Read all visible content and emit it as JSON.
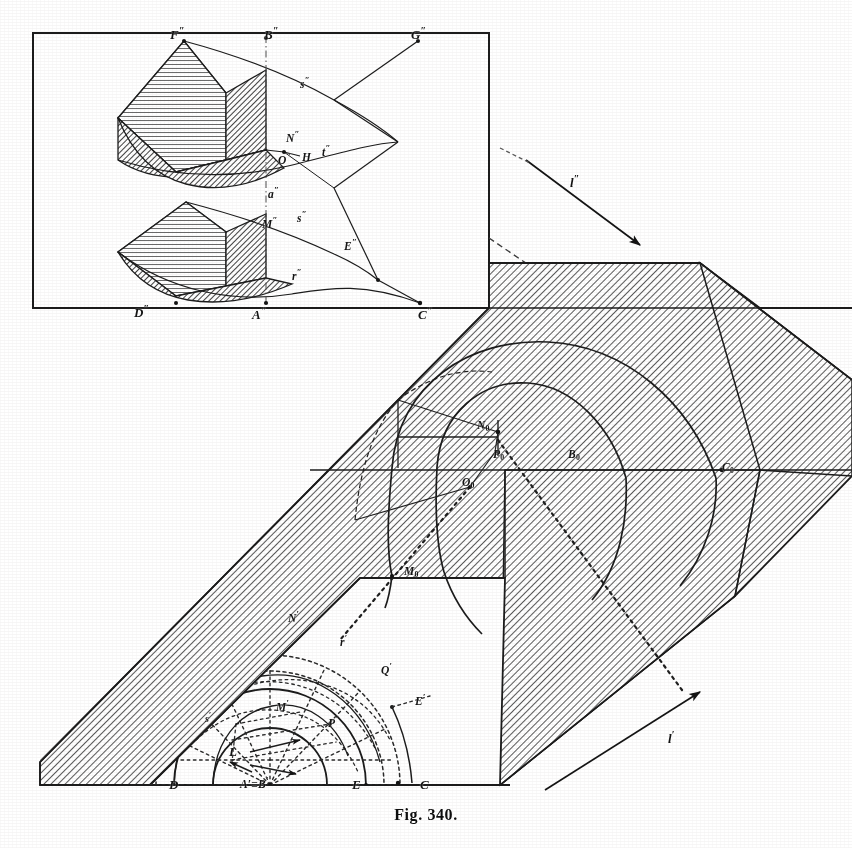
{
  "figure": {
    "caption": "Fig. 340.",
    "title": "Fig. 340.",
    "ink_color": "#1a1a1a",
    "hatch_color": "#555555",
    "paper_color": "#ffffff"
  },
  "upper_view": {
    "name": "vertical projection (elevation)",
    "frame_label": "elevation frame",
    "labels": [
      {
        "id": "F2",
        "text": "F",
        "prime": "\"",
        "x": 170,
        "y": 33
      },
      {
        "id": "B2",
        "text": "B",
        "prime": "\"",
        "x": 270,
        "y": 33
      },
      {
        "id": "G2",
        "text": "G",
        "prime": "\"",
        "x": 417,
        "y": 33
      },
      {
        "id": "s2a",
        "text": "s",
        "prime": "\"",
        "x": 303,
        "y": 82
      },
      {
        "id": "N2",
        "text": "N",
        "prime": "\"",
        "x": 289,
        "y": 136
      },
      {
        "id": "O2",
        "text": "O",
        "prime": "\"",
        "x": 284,
        "y": 158
      },
      {
        "id": "H2",
        "text": "H",
        "prime": "",
        "x": 305,
        "y": 159
      },
      {
        "id": "t2",
        "text": "t",
        "prime": "\"",
        "x": 327,
        "y": 150
      },
      {
        "id": "a2",
        "text": "a",
        "prime": "\"",
        "x": 272,
        "y": 193
      },
      {
        "id": "M2",
        "text": "M",
        "prime": "\"",
        "x": 268,
        "y": 223
      },
      {
        "id": "s2b",
        "text": "s",
        "prime": "\"",
        "x": 300,
        "y": 216
      },
      {
        "id": "E2",
        "text": "E",
        "prime": "\"",
        "x": 347,
        "y": 245
      },
      {
        "id": "r2",
        "text": "r",
        "prime": "\"",
        "x": 295,
        "y": 275
      },
      {
        "id": "D2",
        "text": "D",
        "prime": "\"",
        "x": 140,
        "y": 307
      },
      {
        "id": "A2",
        "text": "A",
        "prime": "\"",
        "x": 258,
        "y": 309
      },
      {
        "id": "C2",
        "text": "C",
        "prime": "\"",
        "x": 424,
        "y": 309
      }
    ],
    "axis_arrow": {
      "label": "l",
      "prime": "\"",
      "x": 574,
      "y": 182
    }
  },
  "solid_view": {
    "name": "pictorial view of wedge-cut prism",
    "labels": [
      {
        "id": "N0",
        "text": "N",
        "sub": "0",
        "x": 482,
        "y": 428
      },
      {
        "id": "P0",
        "text": "P",
        "sub": "0",
        "x": 497,
        "y": 456
      },
      {
        "id": "O0",
        "text": "O",
        "sub": "0",
        "x": 467,
        "y": 484
      },
      {
        "id": "B0",
        "text": "B",
        "sub": "0",
        "x": 573,
        "y": 456
      },
      {
        "id": "Q0",
        "text": "C",
        "sub": "0",
        "x": 727,
        "y": 470
      },
      {
        "id": "M0",
        "text": "M",
        "sub": "0",
        "x": 410,
        "y": 573
      }
    ],
    "axis_arrow": {
      "label": "l",
      "prime": "'",
      "x": 672,
      "y": 738
    }
  },
  "lower_view": {
    "name": "horizontal projection (plan)",
    "labels": [
      {
        "id": "Np",
        "text": "N",
        "prime": "'",
        "x": 292,
        "y": 617
      },
      {
        "id": "rp",
        "text": "r",
        "prime": "'",
        "x": 343,
        "y": 641
      },
      {
        "id": "Qp",
        "text": "Q",
        "prime": "'",
        "x": 385,
        "y": 669
      },
      {
        "id": "Ep",
        "text": "E",
        "prime": "'",
        "x": 419,
        "y": 700
      },
      {
        "id": "Mp",
        "text": "M",
        "prime": "'",
        "x": 281,
        "y": 706
      },
      {
        "id": "Pp",
        "text": "P",
        "prime": "'",
        "x": 332,
        "y": 722
      },
      {
        "id": "sp",
        "text": "s",
        "prime": "'",
        "x": 208,
        "y": 718
      },
      {
        "id": "L",
        "text": "L",
        "prime": "",
        "x": 233,
        "y": 752
      },
      {
        "id": "AB",
        "text": "A'≡B",
        "prime": "'",
        "x": 247,
        "y": 783
      },
      {
        "id": "D",
        "text": "D",
        "prime": "",
        "x": 174,
        "y": 785
      },
      {
        "id": "E",
        "text": "E",
        "prime": "",
        "x": 356,
        "y": 785
      },
      {
        "id": "C",
        "text": "C",
        "prime": "",
        "x": 424,
        "y": 785
      }
    ]
  }
}
